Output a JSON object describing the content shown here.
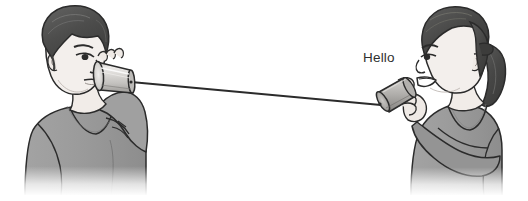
{
  "illustration": {
    "title": "Two children talking through a tin-can string telephone",
    "background_color": "#ffffff",
    "width": 528,
    "height": 201
  },
  "speech": {
    "text": "Hello",
    "color": "#2f2f2f"
  },
  "figures": [
    {
      "id": "boy",
      "label": "boy-listening",
      "side": "left",
      "action": "holding can to ear",
      "hair_color": "#4f4f4f",
      "skin_color": "#f3efec",
      "shirt_color": "#9c9c9c",
      "outline_color": "#2b2b2b"
    },
    {
      "id": "girl",
      "label": "girl-speaking",
      "side": "right",
      "action": "speaking into can",
      "hair_color": "#4a4a4a",
      "skin_color": "#f3efec",
      "shirt_color": "#9c9c9c",
      "outline_color": "#2b2b2b"
    }
  ],
  "objects": {
    "can_left": {
      "label": "tin-can-left",
      "body_color": "#d6d4d1",
      "rim_color": "#b9b7b4",
      "outline_color": "#2b2b2b"
    },
    "can_right": {
      "label": "tin-can-right",
      "body_color": "#a9a7a4",
      "rim_color": "#8f8d8a",
      "outline_color": "#2b2b2b"
    },
    "string": {
      "label": "connecting-string",
      "color": "#2b2b2b",
      "start_x": 133,
      "start_y": 82,
      "end_x": 379,
      "end_y": 104
    }
  },
  "palette": {
    "ink": "#2b2b2b",
    "shirt": "#9c9c9c",
    "shirt_shadow": "#8a8a8a",
    "hair_dark": "#4a4a4a",
    "hair_light": "#6a6a6a",
    "skin": "#f3efec",
    "skin_shadow": "#ddd7d2",
    "metal_light": "#dedcd9",
    "metal_mid": "#bdbbb8",
    "metal_dark": "#8e8c89",
    "white": "#ffffff"
  }
}
